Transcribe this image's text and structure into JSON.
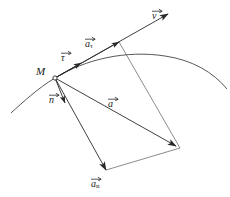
{
  "figure": {
    "background_color": "#ffffff",
    "stroke_color": "#2a2a2a",
    "label_color": "#1a1a1a",
    "point_label": "M",
    "labels": [
      {
        "id": "velocity",
        "symbol": "v",
        "subscript": "",
        "overbar": "arrow",
        "x": 152,
        "y": 8,
        "desc": "velocity vector"
      },
      {
        "id": "tangent-unit",
        "symbol": "τ",
        "subscript": "",
        "overbar": "arrow",
        "x": 61,
        "y": 50,
        "desc": "tangential unit vector tau"
      },
      {
        "id": "tangential-acceleration",
        "symbol": "a",
        "subscript": "τ",
        "overbar": "arrow",
        "x": 85,
        "y": 36,
        "desc": "tangential acceleration"
      },
      {
        "id": "normal-unit",
        "symbol": "n",
        "subscript": "",
        "overbar": "arrow",
        "x": 49,
        "y": 92,
        "desc": "normal unit vector"
      },
      {
        "id": "total-acceleration",
        "symbol": "a",
        "subscript": "",
        "overbar": "arrow",
        "x": 108,
        "y": 96,
        "desc": "total acceleration"
      },
      {
        "id": "normal-acceleration",
        "symbol": "a",
        "subscript": "n",
        "overbar": "arrow",
        "x": 91,
        "y": 176,
        "desc": "normal acceleration"
      }
    ],
    "point_M": {
      "x": 55,
      "y": 78,
      "label_x": 36,
      "label_y": 66
    },
    "geometry": {
      "trajectory_desc": "curved trajectory arc passing through M, concave down",
      "trajectory_path": "M 11 113 C 22 103 38 88 55 78 C 86 59 126 50 165 56 C 192 60 213 72 227 89",
      "velocity_line": {
        "x1": 55,
        "y1": 78,
        "x2": 168,
        "y2": 14,
        "arrow": true
      },
      "tau_arrow": {
        "x1": 55,
        "y1": 78,
        "x2": 80,
        "y2": 64,
        "arrow": true
      },
      "atau_arrow": {
        "x1": 55,
        "y1": 78,
        "x2": 119,
        "y2": 42,
        "arrow": true
      },
      "n_arrow": {
        "x1": 55,
        "y1": 78,
        "x2": 64,
        "y2": 102,
        "arrow": true
      },
      "a_arrow": {
        "x1": 55,
        "y1": 78,
        "x2": 175,
        "y2": 145,
        "arrow": true
      },
      "an_arrow": {
        "x1": 55,
        "y1": 78,
        "x2": 106,
        "y2": 169,
        "arrow": true
      },
      "parallelogram_side_right": {
        "x1": 119,
        "y1": 42,
        "x2": 179,
        "y2": 148
      },
      "parallelogram_side_bottom": {
        "x1": 106,
        "y1": 169,
        "x2": 179,
        "y2": 148
      }
    }
  }
}
